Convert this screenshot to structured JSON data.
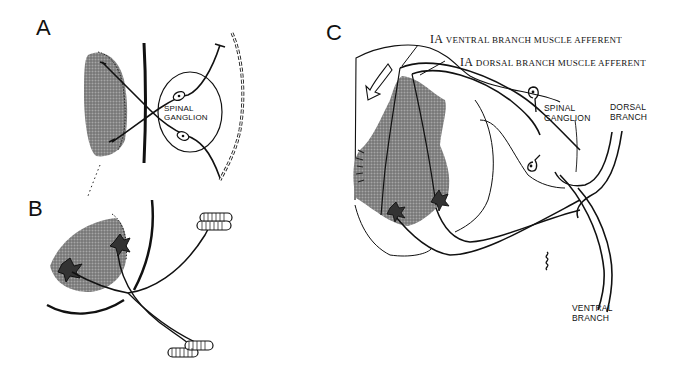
{
  "figure": {
    "panels": [
      {
        "id": "A",
        "label": "A",
        "annotations": {
          "ganglion_line1": "SPINAL",
          "ganglion_line2": "GANGLION"
        }
      },
      {
        "id": "B",
        "label": "B"
      },
      {
        "id": "C",
        "label": "C",
        "annotations": {
          "ventral_afferent_prefix": "IA",
          "ventral_afferent": "VENTRAL BRANCH MUSCLE AFFERENT",
          "dorsal_afferent_prefix": "IA",
          "dorsal_afferent": "DORSAL BRANCH MUSCLE AFFERENT",
          "ganglion_line1": "SPINAL",
          "ganglion_line2": "GANGLION",
          "dorsal_branch_line1": "DORSAL",
          "dorsal_branch_line2": "BRANCH",
          "ventral_branch_line1": "VENTRAL",
          "ventral_branch_line2": "BRANCH"
        }
      }
    ],
    "colors": {
      "ink": "#111111",
      "stipple": "#7a7a7a",
      "background": "#ffffff"
    }
  }
}
